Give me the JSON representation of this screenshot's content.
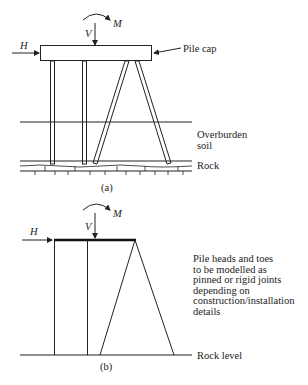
{
  "figure_a": {
    "caption": "(a)",
    "forces": {
      "horizontal": "H",
      "vertical": "V",
      "moment": "M"
    },
    "labels": {
      "pile_cap": "Pile cap",
      "overburden_line1": "Overburden",
      "overburden_line2": "soil",
      "rock": "Rock"
    }
  },
  "figure_b": {
    "caption": "(b)",
    "forces": {
      "horizontal": "H",
      "vertical": "V",
      "moment": "M"
    },
    "note_lines": [
      "Pile heads and toes",
      "to be modelled as",
      "pinned or rigid joints",
      "depending on",
      "construction/installation",
      "details"
    ],
    "rock_level": "Rock level"
  },
  "colors": {
    "line": "#222222",
    "background": "#ffffff"
  }
}
